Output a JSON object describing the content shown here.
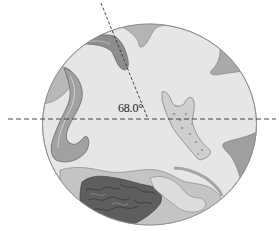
{
  "diagram": {
    "type": "microscope-field-of-view",
    "angle_label": "68.0°",
    "colors": {
      "background": "#ffffff",
      "field": "#e4e4e4",
      "field_border": "#8a8a8a",
      "tissue_light": "#c9c9c9",
      "tissue_mid": "#a6a6a6",
      "tissue_dark": "#6e6e6e",
      "dashed_line": "#333333"
    },
    "field_of_view": {
      "cx": 149.5,
      "cy": 124.5,
      "rx": 107,
      "ry": 100.5
    },
    "reference_line": {
      "x1": 8,
      "y1": 119,
      "x2": 276,
      "y2": 119
    },
    "measurement_line": {
      "x1": 101,
      "y1": 3,
      "x2": 148,
      "y2": 119
    }
  }
}
